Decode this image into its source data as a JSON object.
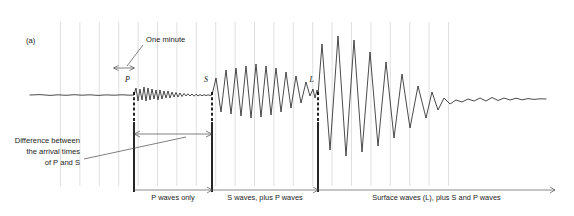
{
  "figure": {
    "panel_label": "(a)",
    "caption_type": "seismogram",
    "background": "#ffffff",
    "trace_color": "#2b2b2b",
    "grid_color": "#c9c9c9",
    "divider_color": "#000000"
  },
  "annotations": {
    "one_minute": "One minute",
    "difference_line1": "Difference between",
    "difference_line2": "the arrival times",
    "difference_line3": "of P and S"
  },
  "phase_markers": [
    {
      "name": "P",
      "label": "P",
      "x": 134
    },
    {
      "name": "S",
      "label": "S",
      "x": 212
    },
    {
      "name": "L",
      "label": "L",
      "x": 318
    }
  ],
  "segments": [
    {
      "name": "p-waves-only",
      "label": "P waves only",
      "start": 134,
      "end": 212
    },
    {
      "name": "s-plus-p-waves",
      "label": "S waves, plus P waves",
      "start": 212,
      "end": 318
    },
    {
      "name": "surface-waves",
      "label": "Surface waves (L), plus S and P waves",
      "start": 318,
      "end": 555
    }
  ],
  "chart_data": {
    "type": "line",
    "title": "",
    "xlabel": "",
    "ylabel": "",
    "grid": true,
    "legend": false,
    "baseline_y": 95,
    "grid_spacing_px": 19.4,
    "grid_first_x": 60.5,
    "grid_count": 21,
    "minute_marker": {
      "x_start": 114,
      "x_end": 134
    },
    "trace_points": "30,95 40,94.6 50,95.4 58,94.8 66,95.3 74,94.7 82,95.2 90,94.8 98,95.4 106,94.9 114,95.2 122,94.8 130,95.2 134,95 136,88 138,101 140,89 142,100 144,87 146,101 148,88 150,100 152,89 154,99 156,90 158,100 160,90 162,99 164,91 166,98 168,91 170,98 172,92 174,97 176,92.5 178,97 180,93 182,96.5 184,93.5 186,96 188,93.8 190,96 192,94 194,96.2 196,94.2 198,96 200,94.5 202,95.8 204,94.6 206,95.6 208,94.8 210,95.4 212,95 216,78 221,112 226,70 231,114 236,68 241,116 246,66 251,118 256,64 261,117 266,66 271,115 276,68 281,112 286,72 291,108 296,76 301,103 306,82 310,96 313,89 315,98 317,90 318,95 322,44 330,150 338,36 346,156 354,40 362,152 370,52 378,146 386,62 394,138 402,74 410,128 418,86 426,118 432,92 438,110 444,98 450,104 456,100 462,102 468,99 474,101 480,98 486,101 492,97.5 498,100.5 504,98 510,100 516,98.2 522,99.8 528,98.6 534,99.4 540,98.8 546,99"
  }
}
